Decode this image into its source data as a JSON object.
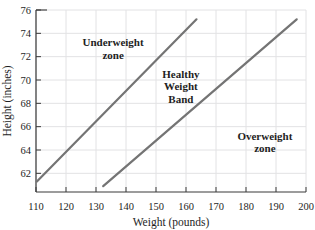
{
  "chart_data": {
    "type": "line",
    "title": "",
    "xlabel": "Weight (pounds)",
    "ylabel": "Height (inches)",
    "xlim": [
      110,
      200
    ],
    "ylim": [
      60.4,
      76
    ],
    "xticks": [
      110,
      120,
      130,
      140,
      150,
      160,
      170,
      180,
      190,
      200
    ],
    "yticks": [
      62,
      64,
      66,
      68,
      70,
      72,
      74,
      76
    ],
    "grid": true,
    "legend": "none",
    "series": [
      {
        "name": "underweight-healthy-boundary",
        "points": [
          [
            110.3,
            61.3
          ],
          [
            163.5,
            75.2
          ]
        ]
      },
      {
        "name": "healthy-overweight-boundary",
        "points": [
          [
            132.4,
            60.9
          ],
          [
            196.9,
            75.2
          ]
        ]
      }
    ],
    "annotations": [
      {
        "name": "underweight-zone-label",
        "lines": [
          "Underweight",
          "zone"
        ],
        "x": 135.7,
        "y": 72.9
      },
      {
        "name": "healthy-weight-band-label",
        "lines": [
          "Healthy",
          "Weight",
          "Band"
        ],
        "x": 158.3,
        "y": 70.2
      },
      {
        "name": "overweight-zone-label",
        "lines": [
          "Overweight",
          "zone"
        ],
        "x": 186.3,
        "y": 64.9
      }
    ],
    "colors": {
      "line": "#747474",
      "grid": "#e2e2e4",
      "axis": "#3a3a3a",
      "text": "#1e1e1e"
    }
  }
}
